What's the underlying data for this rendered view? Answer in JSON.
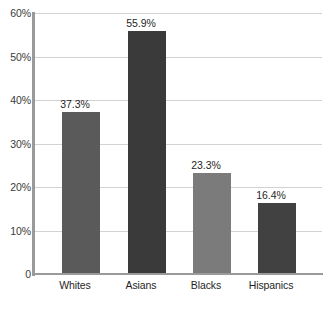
{
  "chart_data": {
    "type": "bar",
    "title": "",
    "subtitle": "",
    "xlabel": "",
    "ylabel": "",
    "categories": [
      "Whites",
      "Asians",
      "Blacks",
      "Hispanics"
    ],
    "values": [
      37.3,
      55.9,
      23.3,
      16.4
    ],
    "value_labels": [
      "37.3%",
      "55.9%",
      "23.3%",
      "16.4%"
    ],
    "bar_colors": [
      "#5a5a5a",
      "#3a3a3a",
      "#7b7b7b",
      "#414141"
    ],
    "ylim": [
      0,
      60
    ],
    "yticks": [
      0,
      10,
      20,
      30,
      40,
      50,
      60
    ],
    "ytick_labels": [
      "0",
      "10%",
      "20%",
      "30%",
      "40%",
      "50%",
      "60%"
    ],
    "grid": true,
    "grid_axis": "y",
    "legend": false,
    "legend_position": "none",
    "annotations": [],
    "axis_color": "#9a9a9a",
    "grid_color": "#d2d2d2",
    "background_color": "#ffffff",
    "text_color": "#1f1f1f"
  }
}
